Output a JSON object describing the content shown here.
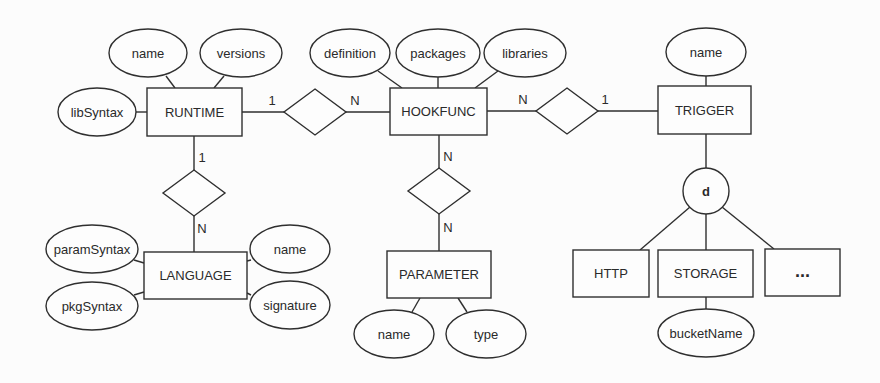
{
  "diagram": {
    "type": "er-diagram",
    "stroke_color": "#2f2f2f",
    "background_color": "#fcfcfc",
    "entities": [
      {
        "id": "runtime",
        "label": "RUNTIME",
        "x": 147,
        "y": 88,
        "w": 95,
        "h": 48
      },
      {
        "id": "hookfunc",
        "label": "HOOKFUNC",
        "x": 390,
        "y": 88,
        "w": 97,
        "h": 47
      },
      {
        "id": "trigger",
        "label": "TRIGGER",
        "x": 658,
        "y": 86,
        "w": 93,
        "h": 48
      },
      {
        "id": "language",
        "label": "LANGUAGE",
        "x": 144,
        "y": 252,
        "w": 103,
        "h": 47
      },
      {
        "id": "parameter",
        "label": "PARAMETER",
        "x": 387,
        "y": 251,
        "w": 104,
        "h": 47
      },
      {
        "id": "http",
        "label": "HTTP",
        "x": 573,
        "y": 250,
        "w": 76,
        "h": 47
      },
      {
        "id": "storage",
        "label": "STORAGE",
        "x": 658,
        "y": 250,
        "w": 95,
        "h": 47
      },
      {
        "id": "more",
        "label": "...",
        "x": 765,
        "y": 249,
        "w": 75,
        "h": 47
      }
    ],
    "attributes": [
      {
        "entity": "runtime",
        "label": "name",
        "cx": 148,
        "cy": 53,
        "rx": 39,
        "ry": 24,
        "lx1": 166,
        "ly1": 76,
        "lx2": 175,
        "ly2": 88
      },
      {
        "entity": "runtime",
        "label": "versions",
        "cx": 241,
        "cy": 53,
        "rx": 41,
        "ry": 24,
        "lx1": 224,
        "ly1": 76,
        "lx2": 214,
        "ly2": 88
      },
      {
        "entity": "runtime",
        "label": "libSyntax",
        "cx": 97,
        "cy": 112,
        "rx": 39,
        "ry": 24,
        "lx1": 136,
        "ly1": 112,
        "lx2": 147,
        "ly2": 112
      },
      {
        "entity": "hookfunc",
        "label": "definition",
        "cx": 350,
        "cy": 53,
        "rx": 40,
        "ry": 24,
        "lx1": 378,
        "ly1": 71,
        "lx2": 402,
        "ly2": 88
      },
      {
        "entity": "hookfunc",
        "label": "packages",
        "cx": 438,
        "cy": 53,
        "rx": 42,
        "ry": 24,
        "lx1": 438,
        "ly1": 77,
        "lx2": 438,
        "ly2": 88
      },
      {
        "entity": "hookfunc",
        "label": "libraries",
        "cx": 525,
        "cy": 53,
        "rx": 41,
        "ry": 24,
        "lx1": 498,
        "ly1": 71,
        "lx2": 475,
        "ly2": 88
      },
      {
        "entity": "trigger",
        "label": "name",
        "cx": 706,
        "cy": 52,
        "rx": 40,
        "ry": 24,
        "lx1": 706,
        "ly1": 76,
        "lx2": 706,
        "ly2": 86
      },
      {
        "entity": "language",
        "label": "paramSyntax",
        "cx": 92,
        "cy": 249,
        "rx": 46,
        "ry": 24,
        "lx1": 134,
        "ly1": 260,
        "lx2": 144,
        "ly2": 263
      },
      {
        "entity": "language",
        "label": "pkgSyntax",
        "cx": 92,
        "cy": 306,
        "rx": 46,
        "ry": 24,
        "lx1": 134,
        "ly1": 295,
        "lx2": 144,
        "ly2": 292
      },
      {
        "entity": "language",
        "label": "name",
        "cx": 290,
        "cy": 249,
        "rx": 40,
        "ry": 24,
        "lx1": 251,
        "ly1": 260,
        "lx2": 247,
        "ly2": 261
      },
      {
        "entity": "language",
        "label": "signature",
        "cx": 290,
        "cy": 305,
        "rx": 40,
        "ry": 24,
        "lx1": 251,
        "ly1": 295,
        "lx2": 247,
        "ly2": 293
      },
      {
        "entity": "parameter",
        "label": "name",
        "cx": 394,
        "cy": 334,
        "rx": 40,
        "ry": 24,
        "lx1": 412,
        "ly1": 312,
        "lx2": 420,
        "ly2": 298
      },
      {
        "entity": "parameter",
        "label": "type",
        "cx": 486,
        "cy": 334,
        "rx": 40,
        "ry": 24,
        "lx1": 467,
        "ly1": 312,
        "lx2": 458,
        "ly2": 298
      },
      {
        "entity": "storage",
        "label": "bucketName",
        "cx": 706,
        "cy": 333,
        "rx": 48,
        "ry": 24,
        "lx1": 706,
        "ly1": 309,
        "lx2": 706,
        "ly2": 297
      }
    ],
    "relationships": [
      {
        "id": "runtime-hookfunc",
        "cx": 315,
        "cy": 112,
        "hw": 31,
        "hh": 23
      },
      {
        "id": "hookfunc-trigger",
        "cx": 567,
        "cy": 111,
        "hw": 31,
        "hh": 23
      },
      {
        "id": "runtime-language",
        "cx": 194,
        "cy": 193,
        "hw": 31,
        "hh": 23
      },
      {
        "id": "hookfunc-parameter",
        "cx": 439,
        "cy": 191,
        "hw": 31,
        "hh": 23
      }
    ],
    "connectors": [
      {
        "x1": 242,
        "y1": 112,
        "x2": 284,
        "y2": 112
      },
      {
        "x1": 346,
        "y1": 112,
        "x2": 390,
        "y2": 112
      },
      {
        "x1": 487,
        "y1": 111,
        "x2": 536,
        "y2": 111
      },
      {
        "x1": 598,
        "y1": 111,
        "x2": 658,
        "y2": 111
      },
      {
        "x1": 194,
        "y1": 136,
        "x2": 194,
        "y2": 170
      },
      {
        "x1": 194,
        "y1": 216,
        "x2": 194,
        "y2": 252
      },
      {
        "x1": 439,
        "y1": 135,
        "x2": 439,
        "y2": 168
      },
      {
        "x1": 439,
        "y1": 214,
        "x2": 439,
        "y2": 251
      },
      {
        "x1": 706,
        "y1": 134,
        "x2": 706,
        "y2": 168
      },
      {
        "x1": 690,
        "y1": 207,
        "x2": 640,
        "y2": 250
      },
      {
        "x1": 706,
        "y1": 214,
        "x2": 706,
        "y2": 250
      },
      {
        "x1": 722,
        "y1": 207,
        "x2": 774,
        "y2": 249
      }
    ],
    "cardinalities": [
      {
        "label": "1",
        "x": 272,
        "y": 100
      },
      {
        "label": "N",
        "x": 355,
        "y": 100
      },
      {
        "label": "N",
        "x": 523,
        "y": 99
      },
      {
        "label": "1",
        "x": 605,
        "y": 99
      },
      {
        "label": "1",
        "x": 202,
        "y": 157
      },
      {
        "label": "N",
        "x": 202,
        "y": 228
      },
      {
        "label": "N",
        "x": 448,
        "y": 156
      },
      {
        "label": "N",
        "x": 448,
        "y": 227
      }
    ],
    "specialization": {
      "label": "d",
      "cx": 706,
      "cy": 191,
      "r": 23,
      "parent": "trigger",
      "children": [
        "http",
        "storage",
        "more"
      ]
    }
  }
}
